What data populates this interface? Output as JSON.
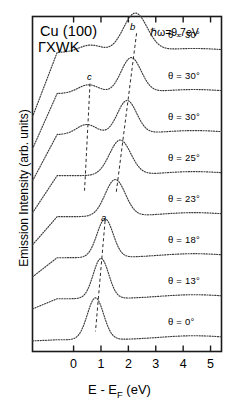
{
  "figure": {
    "sample_label_line1": "Cu (100)",
    "sample_label_line2": "ΓXWK",
    "photon_energy": "ℏω=9.7eV",
    "xlabel_main": "E - E",
    "xlabel_sub": "F",
    "xlabel_unit": " (eV)",
    "ylabel": "Emission Intensity (arb. units)",
    "peak_labels": [
      {
        "name": "a",
        "text": "a"
      },
      {
        "name": "b",
        "text": "b"
      },
      {
        "name": "c",
        "text": "c"
      }
    ]
  },
  "chart_data": {
    "type": "line",
    "xlabel": "E - E_F (eV)",
    "ylabel": "Emission Intensity (arb. units)",
    "xlim": [
      -1.5,
      5.4
    ],
    "ylim": [
      0,
      1
    ],
    "xticks": [
      0,
      1,
      2,
      3,
      4,
      5
    ],
    "xticklabels": [
      "0",
      "1",
      "2",
      "3",
      "4",
      "5"
    ],
    "yticks": [],
    "grid": false,
    "legend": "inline-right-of-each-curve",
    "linestyle": "dotted",
    "annotations": [
      {
        "text": "ℏω=9.7eV",
        "x": 3.3,
        "y": 0.96
      },
      {
        "text": "Cu (100)",
        "x": -1.2,
        "y": 0.97
      },
      {
        "text": "ΓXWK",
        "x": -1.2,
        "y": 0.92
      },
      {
        "text": "a",
        "x": 1.15,
        "y": 0.4
      },
      {
        "text": "b",
        "x": 2.15,
        "y": 0.97
      },
      {
        "text": "c",
        "x": 0.55,
        "y": 0.83
      }
    ],
    "guide_lines": [
      {
        "name": "a",
        "x_start": 1.15,
        "y_start": 0.39,
        "x_end": 0.8,
        "y_end": 0.06
      },
      {
        "name": "b",
        "x_start": 2.3,
        "y_start": 0.95,
        "x_end": 1.55,
        "y_end": 0.47
      },
      {
        "name": "c",
        "x_start": 0.6,
        "y_start": 0.8,
        "x_end": 0.4,
        "y_end": 0.48
      }
    ],
    "series": [
      {
        "name": "theta-30-a",
        "label": "θ = 30°",
        "angle_deg": 30,
        "offset_index": 7,
        "peaks": [
          {
            "label": "b",
            "center": 2.25,
            "height": 0.115,
            "width": 0.62
          },
          {
            "label": "c",
            "center": 0.62,
            "height": 0.022,
            "width": 0.6
          }
        ],
        "baseline": 0.012
      },
      {
        "name": "theta-30-b",
        "label": "θ = 30°",
        "angle_deg": 30,
        "offset_index": 6,
        "peaks": [
          {
            "label": "b",
            "center": 2.1,
            "height": 0.105,
            "width": 0.52
          },
          {
            "label": "c",
            "center": 0.55,
            "height": 0.026,
            "width": 0.55
          }
        ],
        "baseline": 0.012
      },
      {
        "name": "theta-30-c",
        "label": "θ = 30°",
        "angle_deg": 30,
        "offset_index": 5,
        "peaks": [
          {
            "label": "b",
            "center": 1.95,
            "height": 0.1,
            "width": 0.5
          },
          {
            "label": "c",
            "center": 0.48,
            "height": 0.03,
            "width": 0.52
          }
        ],
        "baseline": 0.012
      },
      {
        "name": "theta-25",
        "label": "θ = 25°",
        "angle_deg": 25,
        "offset_index": 4,
        "peaks": [
          {
            "label": "b",
            "center": 1.7,
            "height": 0.105,
            "width": 0.55
          }
        ],
        "baseline": 0.012
      },
      {
        "name": "theta-23",
        "label": "θ = 23°",
        "angle_deg": 23,
        "offset_index": 3,
        "peaks": [
          {
            "label": "b",
            "center": 1.52,
            "height": 0.11,
            "width": 0.52
          }
        ],
        "baseline": 0.012
      },
      {
        "name": "theta-18",
        "label": "θ = 18°",
        "angle_deg": 18,
        "offset_index": 2,
        "peaks": [
          {
            "label": "a",
            "center": 1.15,
            "height": 0.115,
            "width": 0.42
          }
        ],
        "baseline": 0.012
      },
      {
        "name": "theta-13",
        "label": "θ = 13°",
        "angle_deg": 13,
        "offset_index": 1,
        "peaks": [
          {
            "label": "a",
            "center": 1.0,
            "height": 0.12,
            "width": 0.4
          }
        ],
        "baseline": 0.012
      },
      {
        "name": "theta-0",
        "label": "θ = 0°",
        "angle_deg": 0,
        "offset_index": 0,
        "peaks": [
          {
            "label": "a",
            "center": 0.8,
            "height": 0.125,
            "width": 0.42
          }
        ],
        "baseline": 0.012
      }
    ]
  }
}
